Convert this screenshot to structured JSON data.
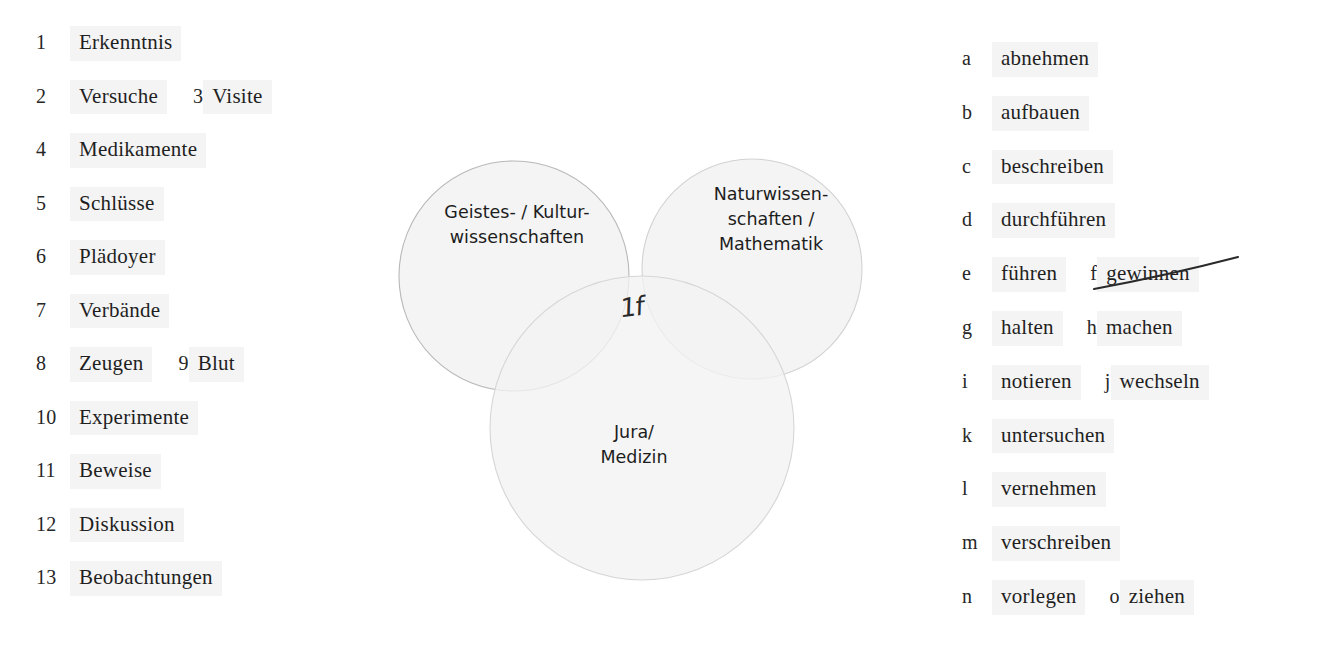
{
  "worksheet": {
    "nouns": [
      {
        "marker": "1",
        "items": [
          {
            "label": "Erkenntnis",
            "crossed": false
          }
        ]
      },
      {
        "marker": "2",
        "items": [
          {
            "label": "Versuche",
            "crossed": false
          },
          {
            "marker": "3",
            "label": "Visite",
            "crossed": false
          }
        ]
      },
      {
        "marker": "4",
        "items": [
          {
            "label": "Medikamente",
            "crossed": false
          }
        ]
      },
      {
        "marker": "5",
        "items": [
          {
            "label": "Schlüsse",
            "crossed": false
          }
        ]
      },
      {
        "marker": "6",
        "items": [
          {
            "label": "Plädoyer",
            "crossed": false
          }
        ]
      },
      {
        "marker": "7",
        "items": [
          {
            "label": "Verbände",
            "crossed": false
          }
        ]
      },
      {
        "marker": "8",
        "items": [
          {
            "label": "Zeugen",
            "crossed": false
          },
          {
            "marker": "9",
            "label": "Blut",
            "crossed": false
          }
        ]
      },
      {
        "marker": "10",
        "items": [
          {
            "label": "Experimente",
            "crossed": false
          }
        ]
      },
      {
        "marker": "11",
        "items": [
          {
            "label": "Beweise",
            "crossed": false
          }
        ]
      },
      {
        "marker": "12",
        "items": [
          {
            "label": "Diskussion",
            "crossed": false
          }
        ]
      },
      {
        "marker": "13",
        "items": [
          {
            "label": "Beobachtungen",
            "crossed": false
          }
        ]
      }
    ],
    "verbs": [
      {
        "marker": "a",
        "items": [
          {
            "label": "abnehmen",
            "crossed": false
          }
        ]
      },
      {
        "marker": "b",
        "items": [
          {
            "label": "aufbauen",
            "crossed": false
          }
        ]
      },
      {
        "marker": "c",
        "items": [
          {
            "label": "beschreiben",
            "crossed": false
          }
        ]
      },
      {
        "marker": "d",
        "items": [
          {
            "label": "durchführen",
            "crossed": false
          }
        ]
      },
      {
        "marker": "e",
        "items": [
          {
            "label": "führen",
            "crossed": false
          },
          {
            "marker": "f",
            "label": "gewinnen",
            "crossed": true
          }
        ]
      },
      {
        "marker": "g",
        "items": [
          {
            "label": "halten",
            "crossed": false
          },
          {
            "marker": "h",
            "label": "machen",
            "crossed": false
          }
        ]
      },
      {
        "marker": "i",
        "items": [
          {
            "label": "notieren",
            "crossed": false
          },
          {
            "marker": "j",
            "label": "wechseln",
            "crossed": false
          }
        ]
      },
      {
        "marker": "k",
        "items": [
          {
            "label": "untersuchen",
            "crossed": false
          }
        ]
      },
      {
        "marker": "l",
        "items": [
          {
            "label": "vernehmen",
            "crossed": false
          }
        ]
      },
      {
        "marker": "m",
        "items": [
          {
            "label": "verschreiben",
            "crossed": false
          }
        ]
      },
      {
        "marker": "n",
        "items": [
          {
            "label": "vorlegen",
            "crossed": false
          },
          {
            "marker": "o",
            "label": "ziehen",
            "crossed": false
          }
        ]
      }
    ]
  },
  "venn": {
    "circles": {
      "left": {
        "label": "Geistes- / Kultur-\nwissenschaften"
      },
      "right": {
        "label": "Naturwissen-\nschaften /\nMathematik"
      },
      "bottom": {
        "label": "Jura/\nMedizin"
      }
    },
    "annotation": "1f",
    "colors": {
      "fill": "#f2f2f2",
      "stroke": "#b9b9b9",
      "chip_background": "#f4f4f4",
      "text": "#1c1c1c",
      "ink": "#2a2a2a"
    }
  }
}
